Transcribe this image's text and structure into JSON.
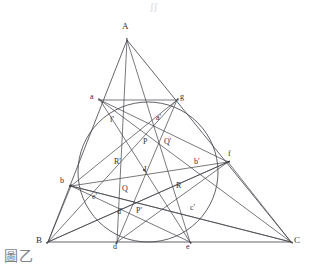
{
  "figure": {
    "caption": "圖乙",
    "top_artifact": "ʃʃ",
    "width": 314,
    "height": 273,
    "stroke_color": "#3f3f46",
    "circle_color": "#45454d",
    "background": "#ffffff"
  },
  "chart_data": {
    "type": "diagram",
    "geometry": "euclidean-plane",
    "points": [
      {
        "id": "A",
        "label": "A",
        "x": 127,
        "y": 40,
        "lx": 122,
        "ly": 22,
        "kind": "vertex"
      },
      {
        "id": "B",
        "label": "B",
        "x": 48,
        "y": 242,
        "lx": 36,
        "ly": 236,
        "kind": "vertex"
      },
      {
        "id": "C",
        "label": "C",
        "x": 291,
        "y": 242,
        "lx": 294,
        "ly": 236,
        "kind": "vertex"
      },
      {
        "id": "I",
        "label": "I",
        "x": 148,
        "y": 170,
        "lx": 144,
        "ly": 166,
        "kind": "center",
        "dot": true
      },
      {
        "id": "d",
        "label": "d",
        "x": 117,
        "y": 242,
        "lx": 113,
        "ly": 243,
        "kind": "tangent"
      },
      {
        "id": "e",
        "label": "e",
        "x": 190,
        "y": 242,
        "lx": 186,
        "ly": 243,
        "kind": "tangent"
      },
      {
        "id": "a",
        "label": "a",
        "x": 100,
        "y": 100,
        "lx": 90,
        "ly": 93,
        "kind": "tangent"
      },
      {
        "id": "g",
        "label": "g",
        "x": 177,
        "y": 100,
        "lx": 180,
        "ly": 93,
        "kind": "tangent"
      },
      {
        "id": "b",
        "label": "b",
        "x": 71,
        "y": 186,
        "lx": 60,
        "ly": 177,
        "kind": "point"
      },
      {
        "id": "f",
        "label": "f",
        "x": 228,
        "y": 162,
        "lx": 228,
        "ly": 150,
        "kind": "point"
      },
      {
        "id": "ap",
        "label": "a'",
        "x": 163,
        "y": 124,
        "lx": 156,
        "ly": 114,
        "kind": "point"
      },
      {
        "id": "bp",
        "label": "b'",
        "x": 200,
        "y": 168,
        "lx": 194,
        "ly": 158,
        "kind": "point"
      },
      {
        "id": "cp",
        "label": "c'",
        "x": 193,
        "y": 212,
        "lx": 190,
        "ly": 204,
        "kind": "point"
      },
      {
        "id": "dp",
        "label": "d'",
        "x": 124,
        "y": 215,
        "lx": 117,
        "ly": 208,
        "kind": "point"
      },
      {
        "id": "ep",
        "label": "e'",
        "x": 99,
        "y": 200,
        "lx": 92,
        "ly": 193,
        "kind": "point"
      },
      {
        "id": "fp",
        "label": "f'",
        "x": 117,
        "y": 125,
        "lx": 110,
        "ly": 116,
        "kind": "point"
      },
      {
        "id": "P",
        "label": "P",
        "x": 151,
        "y": 145,
        "lx": 143,
        "ly": 138,
        "kind": "node"
      },
      {
        "id": "Q",
        "label": "Q",
        "x": 130,
        "y": 192,
        "lx": 122,
        "ly": 185,
        "kind": "node"
      },
      {
        "id": "R",
        "label": "R",
        "x": 182,
        "y": 190,
        "lx": 176,
        "ly": 182,
        "kind": "node"
      },
      {
        "id": "Pp",
        "label": "P'",
        "x": 145,
        "y": 213,
        "lx": 136,
        "ly": 207,
        "kind": "node"
      },
      {
        "id": "Qp",
        "label": "Q'",
        "x": 170,
        "y": 145,
        "lx": 164,
        "ly": 138,
        "kind": "node"
      },
      {
        "id": "Rp",
        "label": "R'",
        "x": 122,
        "y": 165,
        "lx": 114,
        "ly": 158,
        "kind": "node"
      }
    ],
    "incircle": {
      "cx": 148,
      "cy": 172,
      "r": 70
    },
    "segments": [
      {
        "from": "A",
        "to": "B",
        "role": "triangle-side",
        "frame": true
      },
      {
        "from": "A",
        "to": "C",
        "role": "triangle-side",
        "frame": true
      },
      {
        "from": "B",
        "to": "C",
        "role": "triangle-side",
        "frame": true
      },
      {
        "from": "A",
        "to": "d",
        "role": "cevian"
      },
      {
        "from": "A",
        "to": "e",
        "role": "cevian"
      },
      {
        "from": "B",
        "to": "g",
        "role": "cevian"
      },
      {
        "from": "C",
        "to": "a",
        "role": "cevian"
      },
      {
        "from": "a",
        "to": "g",
        "role": "tangent-chord"
      },
      {
        "from": "B",
        "to": "f",
        "role": "cevian-ext"
      },
      {
        "from": "C",
        "to": "b",
        "role": "cevian-ext"
      },
      {
        "from": "b",
        "to": "f",
        "role": "chord"
      },
      {
        "from": "b",
        "to": "C",
        "role": "chord"
      },
      {
        "from": "f",
        "to": "B",
        "role": "chord"
      },
      {
        "from": "f",
        "to": "C",
        "role": "side-ext"
      },
      {
        "from": "b",
        "to": "B",
        "role": "side-ext"
      },
      {
        "from": "d",
        "to": "g",
        "role": "inner-chord"
      },
      {
        "from": "e",
        "to": "a",
        "role": "inner-chord"
      },
      {
        "from": "a",
        "to": "f",
        "role": "inner-chord"
      },
      {
        "from": "g",
        "to": "b",
        "role": "inner-chord"
      },
      {
        "from": "d",
        "to": "f",
        "role": "inner-chord"
      },
      {
        "from": "e",
        "to": "b",
        "role": "inner-chord"
      }
    ],
    "labels_text": [
      "A",
      "B",
      "C",
      "I",
      "a",
      "b",
      "d",
      "e",
      "f",
      "g",
      "a'",
      "b'",
      "c'",
      "d'",
      "e'",
      "f'",
      "P",
      "Q",
      "R",
      "P'",
      "Q'",
      "R'"
    ]
  }
}
